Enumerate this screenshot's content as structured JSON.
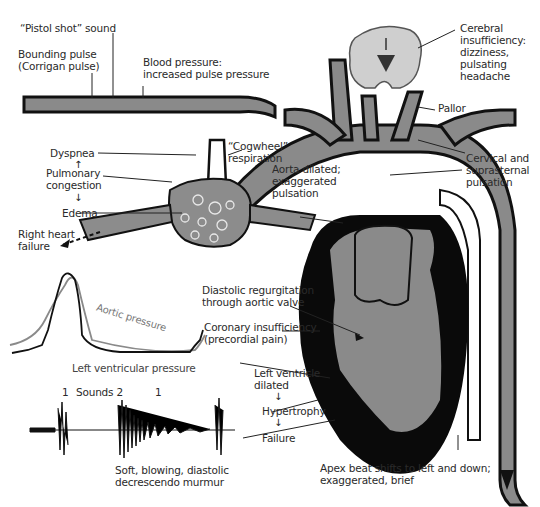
{
  "diagram": {
    "colors": {
      "vessel_fill": "#8a8a8a",
      "vessel_outline": "#111111",
      "myocardium": "#0a0a0a",
      "lung_fill": "#8c8c8c",
      "brain_fill": "#cfcfcf",
      "text": "#2a2a2a",
      "aortic_pressure_line": "#8a8a8a",
      "lv_pressure_line": "#111111"
    },
    "labels": {
      "pistol_shot": "“Pistol shot” sound",
      "bounding_pulse_1": "Bounding pulse",
      "bounding_pulse_2": "(Corrigan pulse)",
      "blood_pressure_1": "Blood pressure:",
      "blood_pressure_2": "increased pulse pressure",
      "cerebral_1": "Cerebral",
      "cerebral_2": "insufficiency:",
      "cerebral_3": "dizziness,",
      "cerebral_4": "pulsating",
      "cerebral_5": "headache",
      "pallor": "Pallor",
      "cervical_1": "Cervical and",
      "cervical_2": "suprasternal",
      "cervical_3": "pulsation",
      "dyspnea": "Dyspnea",
      "pulmonary_1": "Pulmonary",
      "pulmonary_2": "congestion",
      "edema": "Edema",
      "right_heart_1": "Right heart",
      "right_heart_2": "failure",
      "cogwheel_1": "“Cogwheel”",
      "cogwheel_2": "respiration",
      "aorta_1": "Aorta dilated;",
      "aorta_2": "exaggerated",
      "aorta_3": "pulsation",
      "diastolic_1": "Diastolic regurgitation",
      "diastolic_2": "through aortic valve",
      "coronary_1": "Coronary insufficiency",
      "coronary_2": "(precordial pain)",
      "lv_dilated_1": "Left ventricle",
      "lv_dilated_2": "dilated",
      "hypertrophy": "Hypertrophy",
      "failure": "Failure",
      "apex_1": "Apex beat shifts to left and down;",
      "apex_2": "exaggerated, brief",
      "aortic_pressure": "Aortic pressure",
      "lv_pressure": "Left ventricular pressure",
      "sound_1a": "1",
      "sounds_2": "Sounds 2",
      "sound_1b": "1",
      "murmur_1": "Soft, blowing, diastolic",
      "murmur_2": "decrescendo murmur"
    },
    "arrows": {
      "up": "↑",
      "down": "↓"
    }
  }
}
